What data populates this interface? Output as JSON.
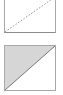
{
  "figure": {
    "width": 63,
    "height": 95,
    "background_color": "#ffffff"
  },
  "colors": {
    "background": "#ffffff",
    "outline": "#a8a8a8",
    "outline_dark": "#8c8c8c",
    "fill_gray": "#d6d6d6",
    "diagonal_solid": "#7a7a7a",
    "diagonal_dashed": "#9a9a9a"
  },
  "shapes": {
    "top": {
      "name": "square-with-dashed-diagonal",
      "label": "",
      "fill": "none",
      "border_color": "#a8a8a8",
      "border_width": 1,
      "diagonal": {
        "style": "dashed",
        "color": "#9a9a9a",
        "dash_pattern": "1.6 1.6",
        "from": "bottom-left",
        "to": "top-right"
      },
      "geometry": {
        "x": 4,
        "y": -3,
        "size": 36
      },
      "edges_visible": [
        "right",
        "bottom"
      ]
    },
    "bottom": {
      "name": "square-with-filled-triangle",
      "label": "",
      "fill": "#d6d6d6",
      "border_color": "#a8a8a8",
      "border_width": 1,
      "diagonal": {
        "style": "solid",
        "color": "#7a7a7a",
        "dash_pattern": "",
        "from": "bottom-left",
        "to": "top-right"
      },
      "geometry": {
        "x": 4,
        "y": 5,
        "size": 51
      },
      "filled_half": "upper-left",
      "edges_visible": [
        "top",
        "right",
        "bottom",
        "left"
      ]
    }
  }
}
